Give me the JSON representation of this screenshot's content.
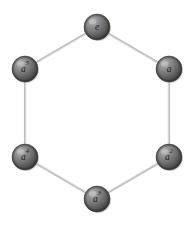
{
  "figure": {
    "background_color": "#ffffff",
    "width": 195,
    "height": 225
  },
  "style": {
    "edge_color": "#bfbfbf",
    "edge_highlight_color": "#e4e4e4",
    "edge_width": 2.2,
    "node_radius": 13,
    "node_base_color": "#6e6e6e",
    "node_dark_color": "#3a3a3a",
    "node_light_color": "#b9b9b9",
    "node_outline_color": "#555555",
    "label_color": "#1b1b1b"
  },
  "graph": {
    "type": "cycle",
    "node_count": 6,
    "edge_count": 6,
    "nodes": [
      {
        "id": "e",
        "base": "e",
        "exponent": "",
        "cx": 97,
        "cy": 27,
        "label": "e"
      },
      {
        "id": "a1",
        "base": "a",
        "exponent": "",
        "cx": 169,
        "cy": 69,
        "label": "a"
      },
      {
        "id": "a2",
        "base": "a",
        "exponent": "2",
        "cx": 169,
        "cy": 157,
        "label": "a2"
      },
      {
        "id": "a3",
        "base": "a",
        "exponent": "3",
        "cx": 97,
        "cy": 199,
        "label": "a3"
      },
      {
        "id": "a4",
        "base": "a",
        "exponent": "4",
        "cx": 25,
        "cy": 157,
        "label": "a4"
      },
      {
        "id": "a5",
        "base": "a",
        "exponent": "5",
        "cx": 25,
        "cy": 69,
        "label": "a5"
      }
    ],
    "edges": [
      {
        "from": "e",
        "to": "a1",
        "x1": 97,
        "y1": 27,
        "x2": 169,
        "y2": 69
      },
      {
        "from": "a1",
        "to": "a2",
        "x1": 169,
        "y1": 69,
        "x2": 169,
        "y2": 157
      },
      {
        "from": "a2",
        "to": "a3",
        "x1": 169,
        "y1": 157,
        "x2": 97,
        "y2": 199
      },
      {
        "from": "a3",
        "to": "a4",
        "x1": 97,
        "y1": 199,
        "x2": 25,
        "y2": 157
      },
      {
        "from": "a4",
        "to": "a5",
        "x1": 25,
        "y1": 157,
        "x2": 25,
        "y2": 69
      },
      {
        "from": "a5",
        "to": "e",
        "x1": 25,
        "y1": 69,
        "x2": 97,
        "y2": 27
      }
    ]
  }
}
